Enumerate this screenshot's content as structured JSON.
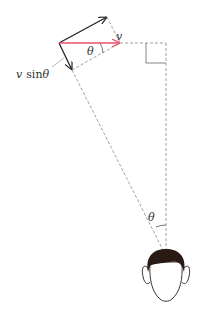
{
  "diagram": {
    "labels": {
      "v": "v",
      "theta_top": "θ",
      "v_sin_theta_var": "v",
      "v_sin_theta_fn": "sin",
      "v_sin_theta_ang": "θ",
      "theta_bottom": "θ"
    },
    "colors": {
      "velocity_arrow": "#e8506a",
      "component_arrows": "#222222",
      "dashed_lines": "#888888",
      "hair": "#2a1a14"
    },
    "elements": [
      "velocity vector v (red, horizontal)",
      "parallel component arrow (up-right)",
      "perpendicular component arrow v sinθ (down)",
      "right-angle marker",
      "line of sight to observer",
      "observer head"
    ]
  }
}
